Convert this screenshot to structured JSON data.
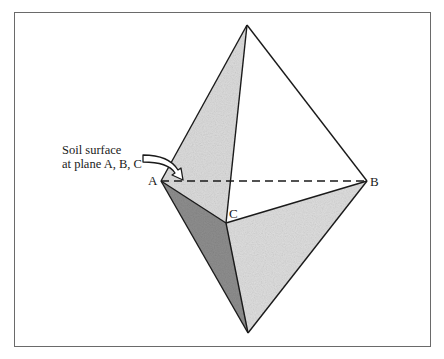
{
  "figure": {
    "type": "tetrahedral diagram (bipyramid)",
    "vertices": {
      "top": {
        "x": 247,
        "y": 25
      },
      "A": {
        "x": 161,
        "y": 181,
        "label": "A"
      },
      "B": {
        "x": 367,
        "y": 181,
        "label": "B"
      },
      "C": {
        "x": 226,
        "y": 223,
        "label": "C"
      },
      "bottom": {
        "x": 248,
        "y": 333
      }
    },
    "labels": {
      "A": "A",
      "B": "B",
      "C": "C"
    },
    "callout": {
      "line1": "Soil surface",
      "line2": "at plane A, B, C"
    },
    "dashed_edge": "A–B",
    "colors": {
      "stroke": "#1a1a1a",
      "face_light": "#e4e4e4",
      "face_mid": "#d2d2d2",
      "face_dark": "#8a8a8a",
      "face_white": "#ffffff",
      "frame": "#6a6a6a"
    }
  }
}
